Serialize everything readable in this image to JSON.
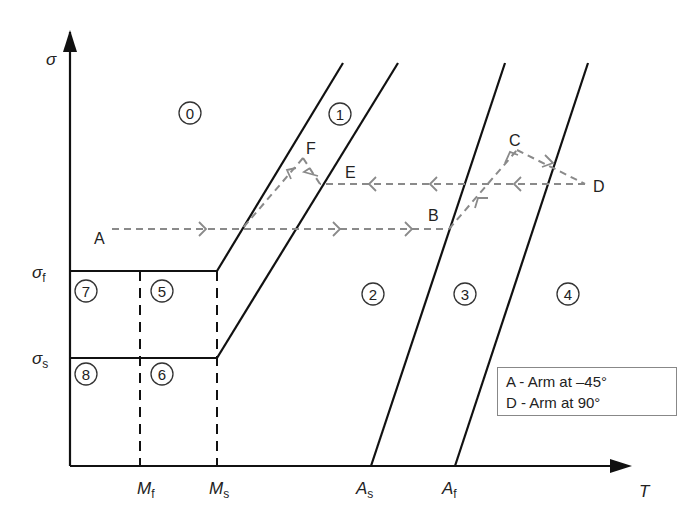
{
  "diagram": {
    "type": "stress-temperature phase diagram (shape memory alloy)",
    "axes": {
      "y_label": "σ",
      "x_label": "T",
      "y_ticks": [
        {
          "symbol": "σ",
          "sub": "f"
        },
        {
          "symbol": "σ",
          "sub": "s"
        }
      ],
      "x_ticks": [
        {
          "symbol": "M",
          "sub": "f"
        },
        {
          "symbol": "M",
          "sub": "s"
        },
        {
          "symbol": "A",
          "sub": "s"
        },
        {
          "symbol": "A",
          "sub": "f"
        }
      ]
    },
    "regions": [
      "0",
      "1",
      "2",
      "3",
      "4",
      "5",
      "6",
      "7",
      "8"
    ],
    "points": [
      "A",
      "B",
      "C",
      "D",
      "E",
      "F"
    ],
    "legend": [
      "A - Arm at –45°",
      "D - Arm at 90°"
    ]
  }
}
